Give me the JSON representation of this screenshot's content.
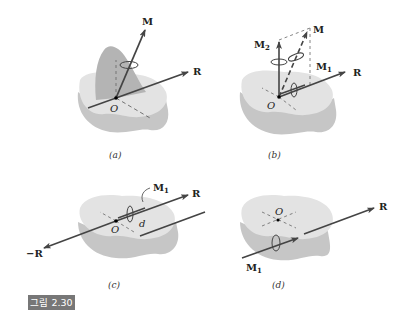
{
  "figure": {
    "label": "그림 2.30",
    "label_bg": "#777777",
    "panels": [
      {
        "id": "a",
        "caption": "(a)",
        "labels": {
          "moment": "M",
          "resultant": "R",
          "origin": "O"
        }
      },
      {
        "id": "b",
        "caption": "(b)",
        "labels": {
          "moment": "M",
          "moment2": "M",
          "moment2_sub": "2",
          "moment1": "M",
          "moment1_sub": "1",
          "resultant": "R",
          "origin": "O"
        }
      },
      {
        "id": "c",
        "caption": "(c)",
        "labels": {
          "moment1": "M",
          "moment1_sub": "1",
          "resultant": "R",
          "neg_resultant": "−R",
          "origin": "O",
          "distance": "d"
        }
      },
      {
        "id": "d",
        "caption": "(d)",
        "labels": {
          "moment1": "M",
          "moment1_sub": "1",
          "resultant": "R",
          "origin": "O"
        }
      }
    ],
    "colors": {
      "body_top": "#e3e3e3",
      "body_side": "#c4c4c4",
      "plane": "#b8b8b8",
      "vector": "#444444"
    }
  }
}
